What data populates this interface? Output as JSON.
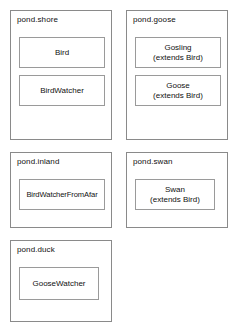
{
  "diagram": {
    "type": "uml-package-diagram",
    "background_color": "#ffffff",
    "border_color": "#8a8a8a",
    "text_color": "#111111",
    "packages": [
      {
        "label": "pond.shore",
        "classes": [
          {
            "name": "Bird",
            "stereotype": ""
          },
          {
            "name": "BirdWatcher",
            "stereotype": ""
          }
        ]
      },
      {
        "label": "pond.goose",
        "classes": [
          {
            "name": "Gosling",
            "stereotype": "(extends Bird)"
          },
          {
            "name": "Goose",
            "stereotype": "(extends Bird)"
          }
        ]
      },
      {
        "label": "pond.inland",
        "classes": [
          {
            "name": "BirdWatcherFromAfar",
            "stereotype": ""
          }
        ]
      },
      {
        "label": "pond.swan",
        "classes": [
          {
            "name": "Swan",
            "stereotype": "(extends Bird)"
          }
        ]
      },
      {
        "label": "pond.duck",
        "classes": [
          {
            "name": "GooseWatcher",
            "stereotype": ""
          }
        ]
      }
    ]
  }
}
